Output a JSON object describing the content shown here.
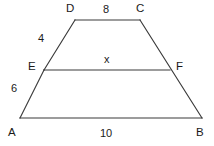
{
  "figure": {
    "kind": "trapezoid-with-transversal",
    "background_color": "#ffffff",
    "stroke_color": "#3a3a3a",
    "text_color": "#1a1a1a",
    "vertices": [
      {
        "name": "D",
        "label": "D",
        "x": 75,
        "y": 20,
        "label_x": 66,
        "label_y": 3
      },
      {
        "name": "C",
        "label": "C",
        "x": 140,
        "y": 20,
        "label_x": 136,
        "label_y": 3
      },
      {
        "name": "E",
        "label": "E",
        "x": 44,
        "y": 70,
        "label_x": 28,
        "label_y": 61
      },
      {
        "name": "F",
        "label": "F",
        "x": 170,
        "y": 70,
        "label_x": 176,
        "label_y": 61
      },
      {
        "name": "A",
        "label": "A",
        "x": 20,
        "y": 118,
        "label_x": 8,
        "label_y": 127
      },
      {
        "name": "B",
        "label": "B",
        "x": 202,
        "y": 118,
        "label_x": 196,
        "label_y": 127
      }
    ],
    "segments": [
      {
        "name": "top-side-DC",
        "from": "D",
        "to": "C"
      },
      {
        "name": "left-upper-side-DE",
        "from": "D",
        "to": "E"
      },
      {
        "name": "left-lower-side-EA",
        "from": "E",
        "to": "A"
      },
      {
        "name": "bottom-side-AB",
        "from": "A",
        "to": "B"
      },
      {
        "name": "right-side-BC",
        "from": "B",
        "to": "C"
      },
      {
        "name": "midsegment-EF",
        "from": "E",
        "to": "F"
      }
    ],
    "measures": [
      {
        "name": "length-DC",
        "text": "8",
        "x": 103,
        "y": 4,
        "for": "top-side-DC"
      },
      {
        "name": "length-DE",
        "text": "4",
        "x": 38,
        "y": 33,
        "for": "left-upper-side-DE"
      },
      {
        "name": "length-EA",
        "text": "6",
        "x": 11,
        "y": 83,
        "for": "left-lower-side-EA"
      },
      {
        "name": "length-AB",
        "text": "10",
        "x": 100,
        "y": 128,
        "for": "bottom-side-AB"
      },
      {
        "name": "length-EF",
        "text": "x",
        "x": 104,
        "y": 54,
        "for": "midsegment-EF"
      }
    ]
  }
}
